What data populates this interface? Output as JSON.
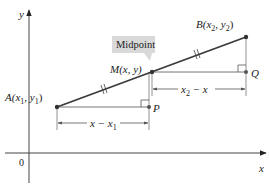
{
  "figure": {
    "axes": {
      "x_label": "x",
      "y_label": "y",
      "origin_label": "0"
    },
    "points": {
      "A": {
        "name": "A",
        "coords_text": "(x",
        "sub1": "1",
        "mid": ", y",
        "sub2": "1",
        "close": ")"
      },
      "B": {
        "name": "B",
        "coords_text": "(x",
        "sub1": "2",
        "mid": ", y",
        "sub2": "2",
        "close": ")"
      },
      "M": {
        "name": "M",
        "coords_text": "(x, y)"
      },
      "P": {
        "name": "P"
      },
      "Q": {
        "name": "Q"
      }
    },
    "callout": {
      "label": "Midpoint",
      "fill": "#d9d9d9"
    },
    "dimensions": {
      "left": {
        "text_a": "x − x",
        "sub": "1"
      },
      "right": {
        "text_a": "x",
        "sub": "2",
        "text_b": " − x"
      }
    },
    "colors": {
      "segment": "#3a3a3a",
      "axis": "#444444",
      "guide": "#777777"
    }
  }
}
